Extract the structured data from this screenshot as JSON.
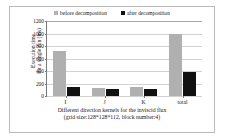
{
  "chart_data": {
    "type": "bar",
    "title": "",
    "categories": [
      "I",
      "J",
      "K",
      "total"
    ],
    "series": [
      {
        "name": "before decomposition",
        "values": [
          720,
          130,
          140,
          1000
        ],
        "color": "#b0b0b0"
      },
      {
        "name": "after decomposition",
        "values": [
          145,
          105,
          118,
          385
        ],
        "color": "#111111"
      }
    ],
    "xlabel": "Different direction kernels for the inviscid flux",
    "xlabel_line2": "(grid size:128*128*112, block number:4)",
    "ylabel_line1": "Execution time",
    "ylabel_line2": "for a single run (ms)",
    "ylim": [
      0,
      1200
    ],
    "yticks": [
      0,
      200,
      400,
      600,
      800,
      1000,
      1200
    ],
    "ytick_labels": [
      "0",
      "200",
      "400",
      "600",
      "800",
      "1000",
      "1200"
    ],
    "grid": true,
    "legend_position": "top"
  },
  "legend": {
    "before_label": "before decomposition",
    "after_label": "after decomposition"
  }
}
